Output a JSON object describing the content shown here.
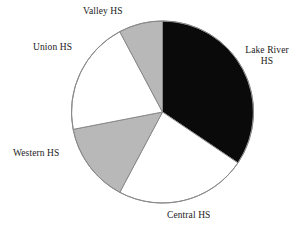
{
  "chart_data": {
    "type": "pie",
    "title": "",
    "subtitle": "",
    "xlabel": "",
    "ylabel": "",
    "legend_position": "none",
    "grid": false,
    "labels_outside": true,
    "categories": [
      "Lake River HS",
      "Central HS",
      "Western HS",
      "Union HS",
      "Valley HS"
    ],
    "values": [
      34,
      23,
      14,
      20,
      9
    ],
    "units": "percent",
    "start_angle_deg": 0,
    "direction": "clockwise",
    "slices": [
      {
        "label": "Lake River HS",
        "label_lines": [
          "Lake River",
          "HS"
        ],
        "value": 34,
        "color": "#0a0a0a",
        "start_deg": 0,
        "end_deg": 124,
        "label_position": "right"
      },
      {
        "label": "Central HS",
        "label_lines": [
          "Central HS"
        ],
        "value": 23,
        "color": "#ffffff",
        "start_deg": 124,
        "end_deg": 208,
        "label_position": "bottom"
      },
      {
        "label": "Western HS",
        "label_lines": [
          "Western HS"
        ],
        "value": 14,
        "color": "#b8b8b8",
        "start_deg": 208,
        "end_deg": 259,
        "label_position": "left"
      },
      {
        "label": "Union HS",
        "label_lines": [
          "Union HS"
        ],
        "value": 20,
        "color": "#ffffff",
        "start_deg": 259,
        "end_deg": 332,
        "label_position": "upper-left"
      },
      {
        "label": "Valley HS",
        "label_lines": [
          "Valley HS"
        ],
        "value": 9,
        "color": "#b8b8b8",
        "start_deg": 332,
        "end_deg": 360,
        "label_position": "top"
      }
    ],
    "geometry": {
      "center_x": 162.5,
      "center_y": 112,
      "radius": 91,
      "outline_color": "#8a8a8a",
      "outline_width": 1
    }
  },
  "labels": {
    "valley": "Valley HS",
    "union": "Union HS",
    "lake_river_line1": "Lake River",
    "lake_river_line2": "HS",
    "western": "Western HS",
    "central": "Central HS"
  }
}
